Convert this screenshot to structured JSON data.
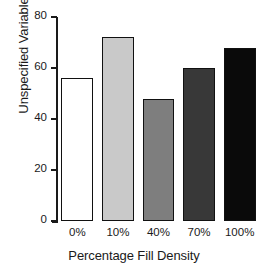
{
  "chart_data": {
    "type": "bar",
    "title": "",
    "categories": [
      "0%",
      "10%",
      "40%",
      "70%",
      "100%"
    ],
    "values": [
      56,
      72,
      48,
      60,
      68
    ],
    "series": [
      {
        "name": "Unspecified Variable",
        "values": [
          56,
          72,
          48,
          60,
          68
        ]
      }
    ],
    "xlabel": "Percentage Fill Density",
    "ylabel": "Unspecified Variable",
    "ylim": [
      0,
      80
    ],
    "yticks": [
      0,
      20,
      40,
      60,
      80
    ],
    "ytick_labels": [
      "0",
      "20",
      "40",
      "60",
      "80"
    ],
    "grid": false,
    "legend": "none",
    "bar_fills": [
      "#ffffff",
      "#c9c9c9",
      "#7e7e7e",
      "#383838",
      "#0a0a0a"
    ],
    "bar_edge_color": "#111111",
    "axis_color": "#1a1a1a",
    "background": "#ffffff"
  }
}
